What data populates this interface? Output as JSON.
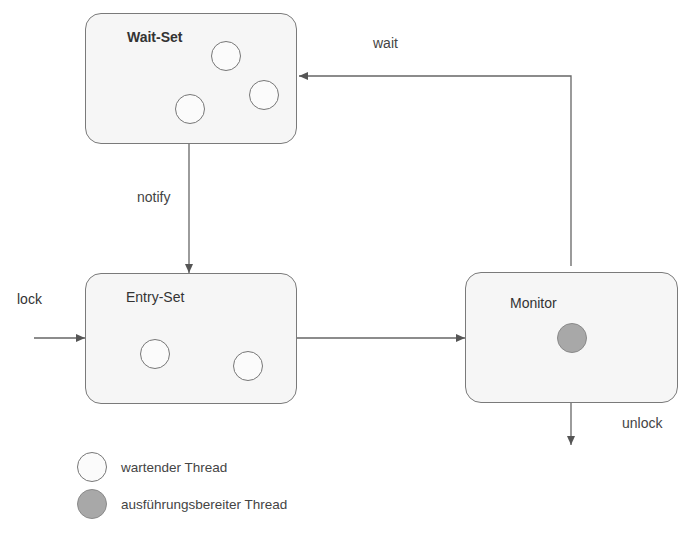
{
  "diagram": {
    "nodes": {
      "wait_set": {
        "title": "Wait-Set",
        "threads": [
          "waiting",
          "waiting",
          "waiting"
        ]
      },
      "entry_set": {
        "title": "Entry-Set",
        "threads": [
          "waiting",
          "waiting"
        ]
      },
      "monitor": {
        "title": "Monitor",
        "threads": [
          "running"
        ]
      }
    },
    "edges": {
      "wait": "wait",
      "notify": "notify",
      "lock": "lock",
      "unlock": "unlock"
    },
    "legend": [
      {
        "type": "waiting",
        "label": "wartender Thread"
      },
      {
        "type": "running",
        "label": "ausführungsbereiter Thread"
      }
    ],
    "colors": {
      "box_border": "#7a7a7a",
      "box_fill": "#f6f6f6",
      "waiting_fill": "#fbfbfb",
      "running_fill": "#a8a8a8",
      "line": "#555555"
    }
  }
}
